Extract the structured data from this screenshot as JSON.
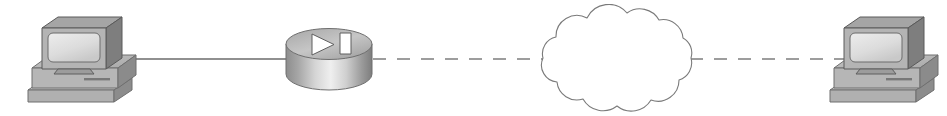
{
  "diagram": {
    "title": "Network topology: workstation to router to WAN cloud to workstation",
    "type": "network-topology",
    "canvas": {
      "width": 947,
      "height": 116,
      "background": "#ffffff"
    },
    "palette": {
      "device_light": "#d9d9d9",
      "device_mid": "#bdbdbd",
      "device_dark": "#8f8f8f",
      "device_shadow": "#6e6e6e",
      "screen_light": "#e9e9e9",
      "screen_mid": "#cfcfcf",
      "outline": "#555555",
      "cloud_outline": "#7a7a7a",
      "link_solid": "#6b6b6b",
      "link_dashed": "#7d7d7d",
      "white": "#ffffff"
    },
    "nodes": [
      {
        "id": "pc-left",
        "name": "workstation-left",
        "icon": "workstation-icon",
        "label": "",
        "shape": "pc",
        "x": 24,
        "y": 14,
        "width": 118,
        "height": 94
      },
      {
        "id": "router",
        "name": "router",
        "icon": "router-icon",
        "label": "",
        "shape": "cylinder",
        "x": 284,
        "y": 28,
        "width": 90,
        "height": 64
      },
      {
        "id": "cloud",
        "name": "wan-cloud",
        "icon": "cloud-icon",
        "label": "",
        "shape": "cloud",
        "x": 531,
        "y": 4,
        "width": 172,
        "height": 108
      },
      {
        "id": "pc-right",
        "name": "workstation-right",
        "icon": "workstation-icon",
        "label": "",
        "shape": "pc",
        "x": 826,
        "y": 14,
        "width": 118,
        "height": 94
      }
    ],
    "links": [
      {
        "id": "link-pc-left-router",
        "name": "link-workstation-left-to-router",
        "style": "solid",
        "label": "",
        "from": "pc-left",
        "to": "router",
        "x1": 110,
        "y1": 59,
        "x2": 290,
        "y2": 59
      },
      {
        "id": "link-router-cloud",
        "name": "link-router-to-cloud",
        "style": "dashed",
        "label": "",
        "from": "router",
        "to": "cloud",
        "x1": 373,
        "y1": 59,
        "x2": 545,
        "y2": 59
      },
      {
        "id": "link-cloud-pc-right",
        "name": "link-cloud-to-workstation-right",
        "style": "dashed",
        "label": "",
        "from": "cloud",
        "to": "pc-right",
        "x1": 690,
        "y1": 59,
        "x2": 862,
        "y2": 59
      }
    ]
  }
}
